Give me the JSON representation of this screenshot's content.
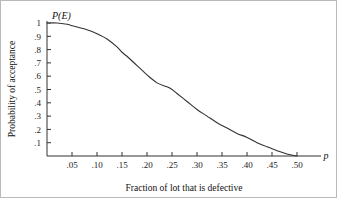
{
  "figure": {
    "background_color": "#ffffff",
    "frame_color": "#b9b9b9",
    "curve_color": "#333333",
    "axis_color": "#333333"
  },
  "chart_data": {
    "type": "line",
    "title": "",
    "subtitle": "",
    "xlabel": "Fraction of lot that is defective",
    "ylabel": "Probability of acceptance",
    "x_axis_symbol": "p",
    "y_axis_symbol": "P(E)",
    "xlim": [
      0,
      0.5
    ],
    "ylim": [
      0,
      1
    ],
    "grid": false,
    "legend": false,
    "legend_position": "none",
    "xticks": [
      0.05,
      0.1,
      0.15,
      0.2,
      0.25,
      0.3,
      0.35,
      0.4,
      0.45,
      0.5
    ],
    "xtick_labels": [
      ".05",
      ".10",
      ".15",
      ".20",
      ".25",
      ".30",
      ".35",
      ".40",
      ".45",
      ".50"
    ],
    "yticks": [
      0.1,
      0.2,
      0.3,
      0.4,
      0.5,
      0.6,
      0.7,
      0.8,
      0.9,
      1.0
    ],
    "ytick_labels": [
      ".1",
      ".2",
      ".3",
      ".4",
      ".5",
      ".6",
      ".7",
      ".8",
      ".9",
      "1"
    ],
    "series": [
      {
        "name": "Probability of acceptance",
        "x": [
          0.0,
          0.02,
          0.04,
          0.05,
          0.06,
          0.08,
          0.1,
          0.12,
          0.14,
          0.15,
          0.16,
          0.18,
          0.2,
          0.22,
          0.24,
          0.25,
          0.26,
          0.28,
          0.3,
          0.32,
          0.34,
          0.35,
          0.36,
          0.38,
          0.4,
          0.42,
          0.44,
          0.45,
          0.46,
          0.48,
          0.5
        ],
        "values": [
          1.0,
          1.0,
          0.99,
          0.98,
          0.97,
          0.95,
          0.92,
          0.88,
          0.82,
          0.78,
          0.75,
          0.68,
          0.61,
          0.55,
          0.52,
          0.5,
          0.47,
          0.41,
          0.35,
          0.3,
          0.25,
          0.23,
          0.21,
          0.17,
          0.14,
          0.1,
          0.07,
          0.055,
          0.04,
          0.015,
          0.0
        ]
      }
    ],
    "annotations": []
  }
}
